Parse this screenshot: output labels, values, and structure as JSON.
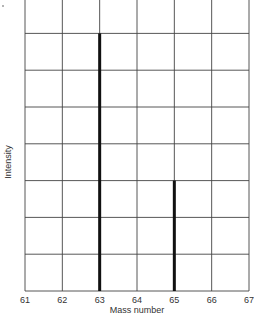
{
  "chart_data": {
    "type": "bar",
    "title": "",
    "xlabel": "Mass number",
    "ylabel": "Intensity",
    "categories": [
      "61",
      "62",
      "63",
      "64",
      "65",
      "66",
      "67"
    ],
    "x": [
      61,
      62,
      63,
      64,
      65,
      66,
      67
    ],
    "values": [
      0,
      0,
      7,
      0,
      3,
      0,
      0
    ],
    "peaks": [
      {
        "mass": 63,
        "intensity": 7
      },
      {
        "mass": 65,
        "intensity": 3
      }
    ],
    "xlim": [
      61,
      67
    ],
    "ylim": [
      0,
      8
    ],
    "grid": true,
    "y_tick_labels": false,
    "colors": {
      "grid": "#444444",
      "bar": "#111111",
      "background": "#ffffff"
    }
  },
  "axis": {
    "xlabel": "Mass number",
    "ylabel": "Intensity",
    "xticks": [
      "61",
      "62",
      "63",
      "64",
      "65",
      "66",
      "67"
    ]
  }
}
